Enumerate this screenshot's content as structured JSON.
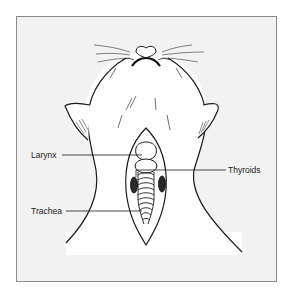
{
  "figure": {
    "colors": {
      "background": "#ffffff",
      "frame_fill": "#f2f2f2",
      "frame_border": "#8a8a8a",
      "line": "#1a1a1a",
      "body_fill": "#ffffff",
      "thyroid_fill": "#2a2a2a"
    },
    "labels": {
      "larynx": "Larynx",
      "thyroids": "Thyroids",
      "trachea": "Trachea"
    }
  }
}
